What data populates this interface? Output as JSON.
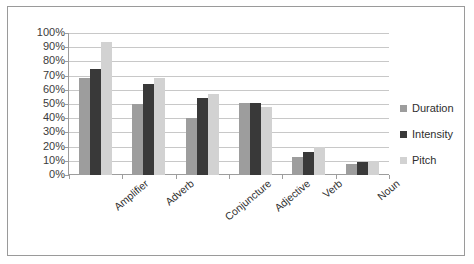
{
  "chart_data": {
    "type": "bar",
    "title": "",
    "subtitle": "",
    "xlabel": "",
    "ylabel": "",
    "categories": [
      "Amplifier",
      "Adverb",
      "Conjuncture",
      "Adjective",
      "Verb",
      "Noun"
    ],
    "series": [
      {
        "name": "Duration",
        "color": "#9d9d9d",
        "values": [
          68,
          50,
          40,
          51,
          13,
          8
        ]
      },
      {
        "name": "Intensity",
        "color": "#393939",
        "values": [
          75,
          64,
          54,
          51,
          16,
          9
        ]
      },
      {
        "name": "Pitch",
        "color": "#d2d2d2",
        "values": [
          94,
          68,
          57,
          48,
          20,
          10
        ]
      }
    ],
    "ylim": [
      0,
      100
    ],
    "ytick_labels": [
      "100%",
      "90%",
      "80%",
      "70%",
      "60%",
      "50%",
      "40%",
      "30%",
      "20%",
      "10%",
      "0%"
    ],
    "ytick_values": [
      100,
      90,
      80,
      70,
      60,
      50,
      40,
      30,
      20,
      10,
      0
    ],
    "grid": true,
    "legend_position": "right",
    "value_suffix": "%"
  },
  "legend": {
    "items": [
      {
        "label": "Duration"
      },
      {
        "label": "Intensity"
      },
      {
        "label": "Pitch"
      }
    ]
  }
}
